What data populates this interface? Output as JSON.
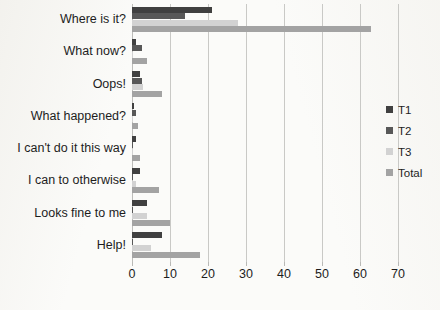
{
  "chart_data": {
    "type": "bar",
    "orientation": "horizontal",
    "title": "",
    "xlabel": "",
    "ylabel": "",
    "xlim": [
      0,
      70
    ],
    "xticks": [
      0,
      10,
      20,
      30,
      40,
      50,
      60,
      70
    ],
    "grid": true,
    "legend_position": "right",
    "categories": [
      "Where is it?",
      "What now?",
      "Oops!",
      "What happened?",
      "I can't do it this way",
      "I can to otherwise",
      "Looks fine to me",
      "Help!"
    ],
    "series": [
      {
        "name": "T1",
        "color": "#404040",
        "values": [
          21,
          1,
          2,
          0.4,
          1,
          2,
          4,
          8
        ]
      },
      {
        "name": "T2",
        "color": "#585858",
        "values": [
          14,
          2.5,
          2.5,
          1,
          0.3,
          0.3,
          0.3,
          0.3
        ]
      },
      {
        "name": "T3",
        "color": "#d2d2d2",
        "values": [
          28,
          0.3,
          3,
          0.3,
          0.3,
          1,
          4,
          5
        ]
      },
      {
        "name": "Total",
        "color": "#a3a3a3",
        "values": [
          63,
          4,
          8,
          1.5,
          2,
          7,
          10,
          18
        ]
      }
    ]
  },
  "legend": {
    "items": [
      {
        "label": "T1"
      },
      {
        "label": "T2"
      },
      {
        "label": "T3"
      },
      {
        "label": "Total"
      }
    ]
  }
}
